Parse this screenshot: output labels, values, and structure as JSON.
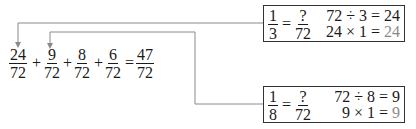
{
  "colors": {
    "arrow": "#8a8a8a",
    "box_border": "#333333",
    "result_highlight": "#8a8a8a",
    "text": "#1a1a1a"
  },
  "main_equation": {
    "terms": [
      {
        "num": "24",
        "den": "72"
      },
      {
        "num": "9",
        "den": "72"
      },
      {
        "num": "8",
        "den": "72"
      },
      {
        "num": "6",
        "den": "72"
      }
    ],
    "operators": [
      "+",
      "+",
      "+",
      "="
    ],
    "result": {
      "num": "47",
      "den": "72"
    }
  },
  "box_top": {
    "left_fraction": {
      "num": "1",
      "den": "3"
    },
    "equals": "=",
    "right_fraction": {
      "num": "?",
      "den": "72"
    },
    "line1": {
      "text": "72 ÷ 3 = 24"
    },
    "line2": {
      "prefix": "24 × 1 = ",
      "result": "24"
    }
  },
  "box_bottom": {
    "left_fraction": {
      "num": "1",
      "den": "8"
    },
    "equals": "=",
    "right_fraction": {
      "num": "?",
      "den": "72"
    },
    "line1": {
      "text": "72 ÷ 8 = 9"
    },
    "line2": {
      "prefix": "9 × 1 = ",
      "result": "9"
    }
  }
}
